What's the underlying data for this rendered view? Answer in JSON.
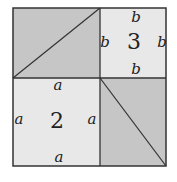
{
  "diagram": {
    "type": "pythagorean-square-dissection",
    "colors": {
      "shaded_fill": "#c6c6c6",
      "light_fill": "#e8e8e8",
      "stroke": "#333333",
      "background": "#ffffff"
    },
    "square_2": {
      "number": "2",
      "side_label": "a",
      "labels": {
        "top": "a",
        "left": "a",
        "right": "a",
        "bottom": "a"
      }
    },
    "square_3": {
      "number": "3",
      "side_label": "b",
      "labels": {
        "top": "b",
        "left": "b",
        "right": "b",
        "bottom": "b"
      }
    },
    "shaded_rectangles": [
      {
        "name": "top-left-rectangle",
        "diagonal": "bottom-left to top-right"
      },
      {
        "name": "bottom-right-rectangle",
        "diagonal": "top-left to bottom-right"
      }
    ]
  }
}
